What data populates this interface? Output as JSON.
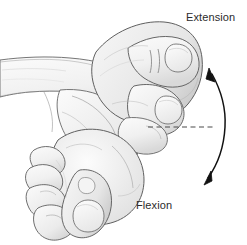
{
  "figure": {
    "background_color": "#ffffff",
    "width": 247,
    "height": 245
  },
  "labels": {
    "extension": "Extension",
    "flexion": "Flexion",
    "text_color": "#2b2b2b"
  },
  "illustration": {
    "style": "pencil line drawing",
    "line_color": "#555555",
    "shade_light": "#f4f4f4",
    "shade_mid": "#e4e4e4",
    "shade_dark": "#cfcfcf",
    "parts": [
      {
        "name": "examiner-forearm",
        "description": "Forearm entering from left, crossing horizontally"
      },
      {
        "name": "upper-hand-fist",
        "description": "Closed fist raised in wrist extension, thumb and nail visible at upper right"
      },
      {
        "name": "lower-hand-fist",
        "description": "Closed fist dropped in wrist flexion, curled fingers and thumb nail visible at lower left"
      }
    ]
  },
  "annotations": {
    "reference_line": {
      "name": "neutral-reference-line",
      "style": "dashed",
      "color": "#4a4a4a",
      "y": 127,
      "x_start": 148,
      "x_end": 216
    },
    "arc_arrow": {
      "name": "range-of-motion-arrow",
      "color": "#1a1a1a",
      "double_headed": true,
      "top_point": "Extension",
      "bottom_point": "Flexion"
    }
  }
}
